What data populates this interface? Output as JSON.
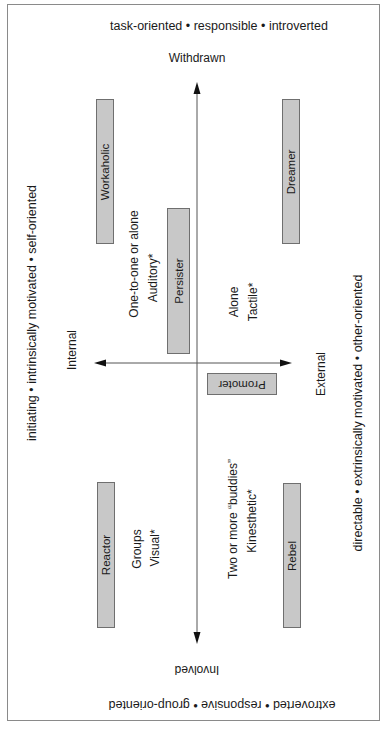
{
  "diagram": {
    "top_traits": "task-oriented • responsible • introverted",
    "bottom_traits": "extroverted • responsive • group-oriented",
    "left_traits": "initiating • intrinsically motivated • self-oriented",
    "right_traits": "directable • extrinsically motivated • other-oriented",
    "axes": {
      "top": "Withdrawn",
      "bottom": "Involved",
      "left": "Internal",
      "right": "External"
    },
    "types": [
      {
        "label": "Workaholic"
      },
      {
        "label": "Persister"
      },
      {
        "label": "Dreamer"
      },
      {
        "label": "Promoter"
      },
      {
        "label": "Reactor"
      },
      {
        "label": "Rebel"
      }
    ],
    "quadrant_notes": {
      "upper_left": [
        "One-to-one or alone",
        "Auditory*"
      ],
      "upper_right": [
        "Alone",
        "Tactile*"
      ],
      "lower_left": [
        "Groups",
        "Visual*"
      ],
      "lower_right": [
        "Two or more “buddies”",
        "Kinesthetic*"
      ]
    },
    "colors": {
      "box_fill": "#c8c8c8",
      "box_border": "#6f6f6f",
      "frame": "#8a8a8a",
      "axis": "#555555"
    }
  }
}
